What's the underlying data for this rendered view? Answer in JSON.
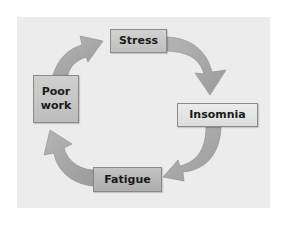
{
  "diagram": {
    "type": "cycle",
    "nodes": [
      {
        "id": "stress",
        "label": "Stress"
      },
      {
        "id": "insomnia",
        "label": "Insomnia"
      },
      {
        "id": "fatigue",
        "label": "Fatigue"
      },
      {
        "id": "poor_work",
        "label": "Poor\nwork"
      }
    ],
    "edges": [
      {
        "from": "stress",
        "to": "insomnia"
      },
      {
        "from": "insomnia",
        "to": "fatigue"
      },
      {
        "from": "fatigue",
        "to": "poor_work"
      },
      {
        "from": "poor_work",
        "to": "stress"
      }
    ],
    "colors": {
      "panel": "#ececec",
      "arrow": "#a9a9a9",
      "arrow_edge": "#8c8c8c",
      "box_border": "#8a8a8a",
      "text": "#1a1a1a"
    }
  }
}
